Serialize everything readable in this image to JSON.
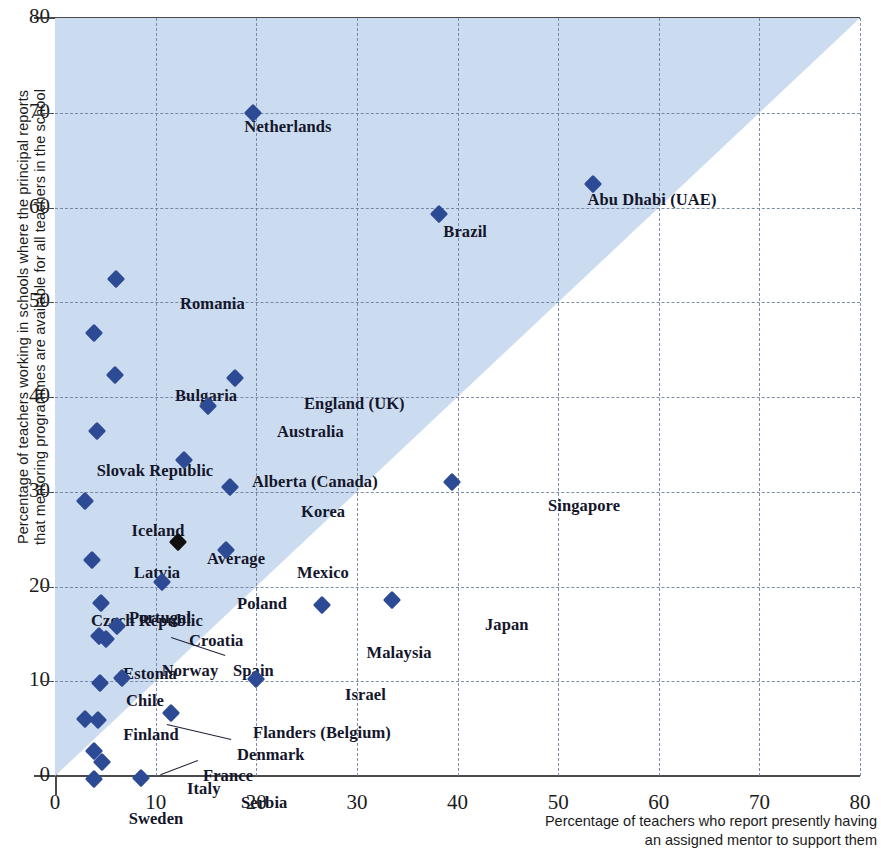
{
  "chart_data": {
    "type": "scatter",
    "title": "",
    "xlabel": "Percentage of teachers who report presently having an assigned mentor to support them",
    "ylabel": "Percentage of teachers working in schools where the principal reports that mentoring programmes are available for all teachers in the school",
    "xlim": [
      0,
      80
    ],
    "ylim": [
      0,
      80
    ],
    "xticks": [
      0,
      10,
      20,
      30,
      40,
      50,
      60,
      70,
      80
    ],
    "yticks": [
      0,
      10,
      20,
      30,
      40,
      50,
      60,
      70,
      80
    ],
    "grid": true,
    "legend": "none",
    "annotations": [
      "Shaded triangular region above the y = x diagonal"
    ],
    "points": [
      {
        "label": "Netherlands",
        "x": 19.7,
        "y": 70.0,
        "lx": 233,
        "ly": 99,
        "anchor": "center",
        "series": "country"
      },
      {
        "label": "Abu Dhabi (UAE)",
        "x": 53.5,
        "y": 62.5,
        "lx": 597,
        "ly": 172,
        "anchor": "center",
        "series": "country"
      },
      {
        "label": "Brazil",
        "x": 38.2,
        "y": 59.3,
        "lx": 432,
        "ly": 204,
        "anchor": "right",
        "series": "country"
      },
      {
        "label": "Romania",
        "x": 6.1,
        "y": 52.5,
        "lx": 125,
        "ly": 276,
        "anchor": "left",
        "series": "country"
      },
      {
        "label": "Slovak Republic",
        "x": 3.9,
        "y": 46.8,
        "lx": 100,
        "ly": 443,
        "anchor": "center",
        "series": "country"
      },
      {
        "label": "Bulgaria",
        "x": 6.0,
        "y": 42.3,
        "lx": 120,
        "ly": 368,
        "anchor": "left",
        "series": "country"
      },
      {
        "label": "England (UK)",
        "x": 17.9,
        "y": 42.0,
        "lx": 249,
        "ly": 376,
        "anchor": "left",
        "series": "country"
      },
      {
        "label": "Australia",
        "x": 15.2,
        "y": 39.0,
        "lx": 222,
        "ly": 404,
        "anchor": "left",
        "series": "country"
      },
      {
        "label": "Iceland",
        "x": 4.2,
        "y": 36.4,
        "lx": 103,
        "ly": 503,
        "anchor": "center",
        "series": "country"
      },
      {
        "label": "Alberta (Canada)",
        "x": 12.8,
        "y": 33.3,
        "lx": 197,
        "ly": 454,
        "anchor": "left",
        "series": "country"
      },
      {
        "label": "Korea",
        "x": 17.4,
        "y": 30.5,
        "lx": 246,
        "ly": 484,
        "anchor": "left",
        "series": "country"
      },
      {
        "label": "Singapore",
        "x": 39.5,
        "y": 31.0,
        "lx": 493,
        "ly": 478,
        "anchor": "left",
        "series": "country"
      },
      {
        "label": "Czech Republic",
        "x": 3.0,
        "y": 29.0,
        "lx": 92,
        "ly": 593,
        "anchor": "center",
        "series": "country"
      },
      {
        "label": "Average",
        "x": 12.2,
        "y": 24.7,
        "lx": 181,
        "ly": 531,
        "anchor": "center",
        "series": "average"
      },
      {
        "label": "Mexico",
        "x": 17.0,
        "y": 23.9,
        "lx": 242,
        "ly": 545,
        "anchor": "left",
        "series": "country"
      },
      {
        "label": "Latvia",
        "x": 3.7,
        "y": 22.8,
        "lx": 102,
        "ly": 545,
        "anchor": "center",
        "series": "country"
      },
      {
        "label": "Poland",
        "x": 10.6,
        "y": 20.5,
        "lx": 182,
        "ly": 576,
        "anchor": "left",
        "series": "country"
      },
      {
        "label": "Portugal",
        "x": 4.6,
        "y": 18.3,
        "lx": 105,
        "ly": 590,
        "anchor": "center",
        "series": "country"
      },
      {
        "label": "Japan",
        "x": 33.5,
        "y": 18.6,
        "lx": 430,
        "ly": 597,
        "anchor": "left",
        "series": "country"
      },
      {
        "label": "Malaysia",
        "x": 26.5,
        "y": 18.0,
        "lx": 344,
        "ly": 625,
        "anchor": "center",
        "series": "country"
      },
      {
        "label": "Croatia",
        "x": 6.2,
        "y": 15.8,
        "lx": 134,
        "ly": 613,
        "anchor": "left",
        "series": "country"
      },
      {
        "label": "Estonia",
        "x": 4.4,
        "y": 14.8,
        "lx": 95,
        "ly": 646,
        "anchor": "center",
        "series": "country"
      },
      {
        "label": "Spain",
        "x": 5.1,
        "y": 14.5,
        "lx": 178,
        "ly": 643,
        "anchor": "left",
        "series": "country"
      },
      {
        "label": "Norway",
        "x": 6.7,
        "y": 10.3,
        "lx": 135,
        "ly": 643,
        "anchor": "center",
        "series": "country"
      },
      {
        "label": "Chile",
        "x": 4.5,
        "y": 9.8,
        "lx": 90,
        "ly": 673,
        "anchor": "center",
        "series": "country"
      },
      {
        "label": "Israel",
        "x": 20.0,
        "y": 10.2,
        "lx": 290,
        "ly": 667,
        "anchor": "left",
        "series": "country"
      },
      {
        "label": "Finland",
        "x": 3.0,
        "y": 6.0,
        "lx": 96,
        "ly": 707,
        "anchor": "center",
        "series": "country"
      },
      {
        "label": "Denmark",
        "x": 4.3,
        "y": 5.9,
        "lx": 182,
        "ly": 727,
        "anchor": "left",
        "series": "country"
      },
      {
        "label": "Flanders (Belgium)",
        "x": 11.5,
        "y": 6.6,
        "lx": 198,
        "ly": 705,
        "anchor": "left",
        "series": "country"
      },
      {
        "label": "France",
        "x": 3.9,
        "y": 2.6,
        "lx": 148,
        "ly": 748,
        "anchor": "left",
        "series": "country"
      },
      {
        "label": "Italy",
        "x": 4.7,
        "y": 1.5,
        "lx": 132,
        "ly": 761,
        "anchor": "left",
        "series": "country"
      },
      {
        "label": "Sweden",
        "x": 3.9,
        "y": -0.3,
        "lx": 101,
        "ly": 791,
        "anchor": "center",
        "series": "country"
      },
      {
        "label": "Serbia",
        "x": 8.5,
        "y": -0.2,
        "lx": 186,
        "ly": 775,
        "anchor": "left",
        "series": "country"
      }
    ],
    "leaders": [
      {
        "from": "Spain",
        "x1": 170,
        "y1": 638,
        "x2": 116,
        "y2": 620
      },
      {
        "from": "Denmark",
        "x1": 176,
        "y1": 722,
        "x2": 112,
        "y2": 707
      },
      {
        "from": "France",
        "x1": 143,
        "y1": 743,
        "x2": 106,
        "y2": 757
      }
    ],
    "colors": {
      "marker": "#2d4b94",
      "average_marker": "#10100f",
      "shaded_region": "#ccdcf0",
      "grid": "#6b7a99",
      "axis": "#4a4a4a",
      "text": "#14162b"
    }
  }
}
